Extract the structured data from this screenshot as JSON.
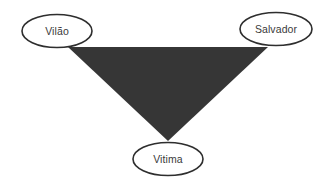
{
  "diagram": {
    "name": "drama-triangle",
    "background_color": "#ffffff",
    "shape": {
      "name": "inverted-triangle",
      "fill_color": "#363636",
      "points": "68,47 268,47 168,141"
    },
    "nodes": [
      {
        "id": "vilao",
        "label": "Vilão",
        "cx": 57,
        "cy": 31,
        "rx": 35,
        "ry": 16.5,
        "fill": "#ffffff",
        "stroke": "#2e2e2e"
      },
      {
        "id": "salvador",
        "label": "Salvador",
        "cx": 276,
        "cy": 29,
        "rx": 36,
        "ry": 16.5,
        "fill": "#ffffff",
        "stroke": "#2e2e2e"
      },
      {
        "id": "vitima",
        "label": "Vitima",
        "cx": 168,
        "cy": 159,
        "rx": 35,
        "ry": 16.5,
        "fill": "#ffffff",
        "stroke": "#2e2e2e"
      }
    ]
  }
}
